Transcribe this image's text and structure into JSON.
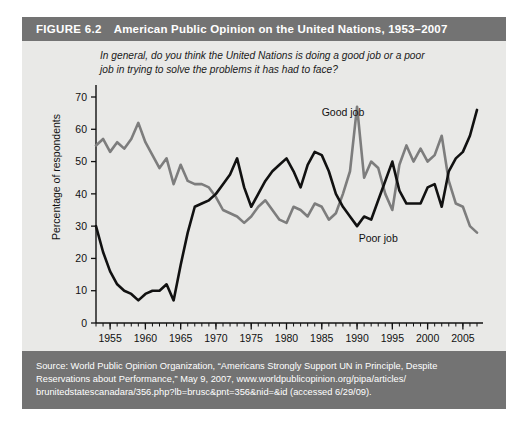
{
  "figure": {
    "number": "FIGURE 6.2",
    "title": "American Public Opinion on the United Nations, 1953–2007",
    "header_color": "#737373",
    "panel_color": "#e9e9e7"
  },
  "question": "In general, do you think the United Nations is doing a good job or a poor job in trying to solve the problems it has had to face?",
  "source": {
    "line1": "Source: World Public Opinion Organization, “Americans Strongly Support UN in Principle, Despite",
    "line2": "Reservations about Performance,” May 9, 2007, www.worldpublicopinion.org/pipa/articles/",
    "line3": "brunitedstatescanadara/356.php?lb=brusc&pnt=356&nid=&id (accessed 6/29/09)."
  },
  "chart_data": {
    "type": "line",
    "title": "American Public Opinion on the United Nations, 1953–2007",
    "xlabel": "",
    "ylabel": "Percentage of respondents",
    "xlim": [
      1953,
      2007
    ],
    "ylim": [
      0,
      70
    ],
    "yticks": [
      0,
      10,
      20,
      30,
      40,
      50,
      60,
      70
    ],
    "xticks": [
      1955,
      1960,
      1965,
      1970,
      1975,
      1980,
      1985,
      1990,
      1995,
      2000,
      2005
    ],
    "xtick_labels": [
      "1955",
      "1960",
      "1965",
      "1970",
      "1975",
      "1980",
      "1985",
      "1990",
      "1995",
      "2000",
      "2005"
    ],
    "ytick_labels": [
      "0",
      "10",
      "20",
      "30",
      "40",
      "50",
      "60",
      "70"
    ],
    "x_minor_tick_step": 1,
    "grid": false,
    "legend_position": "inline-annotation",
    "series": [
      {
        "name": "Good job",
        "color": "#7d7d7d",
        "label_x": 1988,
        "label_y": 64,
        "points": [
          [
            1953,
            55
          ],
          [
            1954,
            57
          ],
          [
            1955,
            53
          ],
          [
            1956,
            56
          ],
          [
            1957,
            54
          ],
          [
            1958,
            57
          ],
          [
            1959,
            62
          ],
          [
            1960,
            56
          ],
          [
            1961,
            52
          ],
          [
            1962,
            48
          ],
          [
            1963,
            51
          ],
          [
            1964,
            43
          ],
          [
            1965,
            49
          ],
          [
            1966,
            44
          ],
          [
            1967,
            43
          ],
          [
            1968,
            43
          ],
          [
            1969,
            42
          ],
          [
            1970,
            39
          ],
          [
            1971,
            35
          ],
          [
            1972,
            34
          ],
          [
            1973,
            33
          ],
          [
            1974,
            31
          ],
          [
            1975,
            33
          ],
          [
            1976,
            36
          ],
          [
            1977,
            38
          ],
          [
            1978,
            35
          ],
          [
            1979,
            32
          ],
          [
            1980,
            31
          ],
          [
            1981,
            36
          ],
          [
            1982,
            35
          ],
          [
            1983,
            33
          ],
          [
            1984,
            37
          ],
          [
            1985,
            36
          ],
          [
            1986,
            32
          ],
          [
            1987,
            34
          ],
          [
            1988,
            40
          ],
          [
            1989,
            47
          ],
          [
            1990,
            67
          ],
          [
            1991,
            45
          ],
          [
            1992,
            50
          ],
          [
            1993,
            48
          ],
          [
            1994,
            40
          ],
          [
            1995,
            35
          ],
          [
            1996,
            49
          ],
          [
            1997,
            55
          ],
          [
            1998,
            50
          ],
          [
            1999,
            54
          ],
          [
            2000,
            50
          ],
          [
            2001,
            52
          ],
          [
            2002,
            58
          ],
          [
            2003,
            44
          ],
          [
            2004,
            37
          ],
          [
            2005,
            36
          ],
          [
            2006,
            30
          ],
          [
            2007,
            28
          ]
        ]
      },
      {
        "name": "Poor job",
        "color": "#111111",
        "label_x": 1993,
        "label_y": 25,
        "points": [
          [
            1953,
            30
          ],
          [
            1954,
            22
          ],
          [
            1955,
            16
          ],
          [
            1956,
            12
          ],
          [
            1957,
            10
          ],
          [
            1958,
            9
          ],
          [
            1959,
            7
          ],
          [
            1960,
            9
          ],
          [
            1961,
            10
          ],
          [
            1962,
            10
          ],
          [
            1963,
            12
          ],
          [
            1964,
            7
          ],
          [
            1965,
            18
          ],
          [
            1966,
            28
          ],
          [
            1967,
            36
          ],
          [
            1968,
            37
          ],
          [
            1969,
            38
          ],
          [
            1970,
            40
          ],
          [
            1971,
            43
          ],
          [
            1972,
            46
          ],
          [
            1973,
            51
          ],
          [
            1974,
            42
          ],
          [
            1975,
            36
          ],
          [
            1976,
            40
          ],
          [
            1977,
            44
          ],
          [
            1978,
            47
          ],
          [
            1979,
            49
          ],
          [
            1980,
            51
          ],
          [
            1981,
            47
          ],
          [
            1982,
            42
          ],
          [
            1983,
            49
          ],
          [
            1984,
            53
          ],
          [
            1985,
            52
          ],
          [
            1986,
            47
          ],
          [
            1987,
            40
          ],
          [
            1988,
            36
          ],
          [
            1989,
            33
          ],
          [
            1990,
            30
          ],
          [
            1991,
            33
          ],
          [
            1992,
            32
          ],
          [
            1993,
            38
          ],
          [
            1994,
            44
          ],
          [
            1995,
            50
          ],
          [
            1996,
            41
          ],
          [
            1997,
            37
          ],
          [
            1998,
            37
          ],
          [
            1999,
            37
          ],
          [
            2000,
            42
          ],
          [
            2001,
            43
          ],
          [
            2002,
            36
          ],
          [
            2003,
            47
          ],
          [
            2004,
            51
          ],
          [
            2005,
            53
          ],
          [
            2006,
            58
          ],
          [
            2007,
            66
          ]
        ]
      }
    ]
  }
}
